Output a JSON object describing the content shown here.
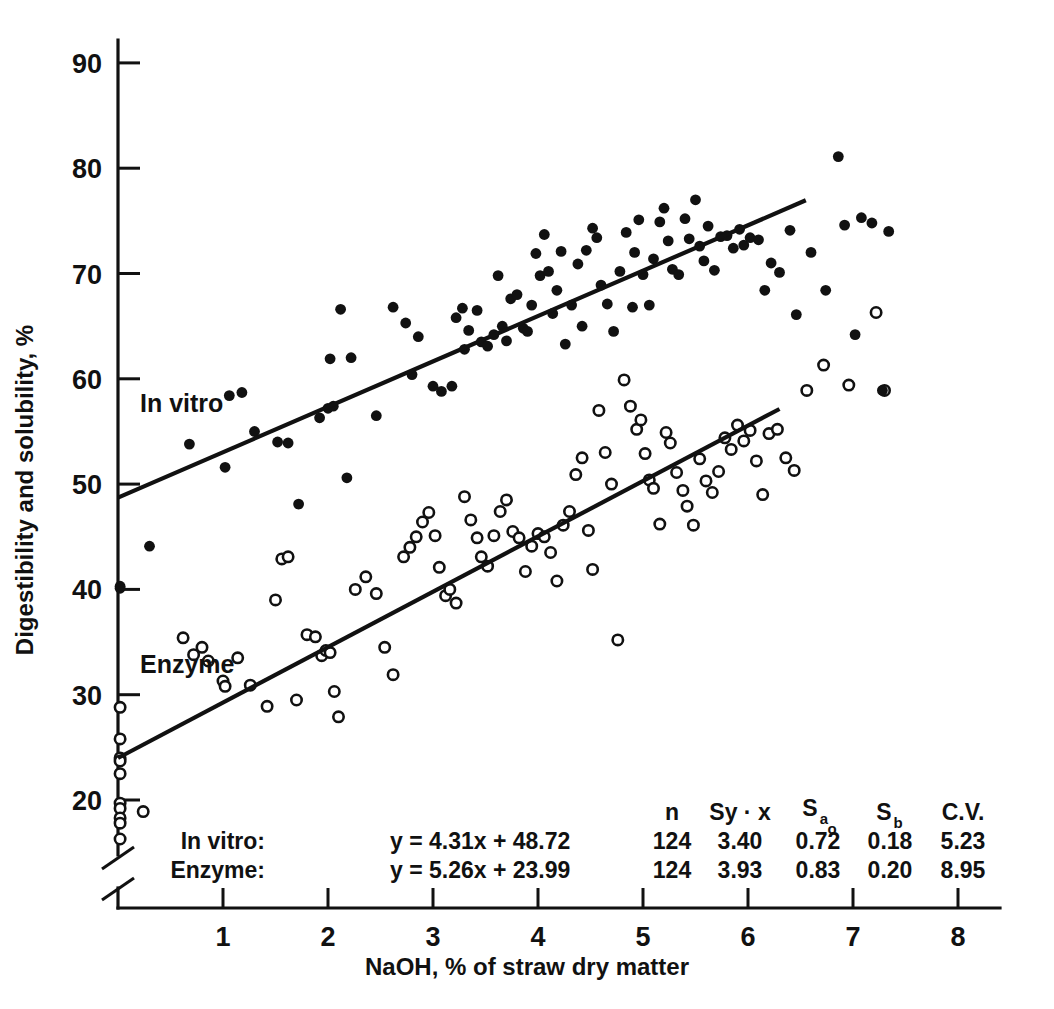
{
  "chart_data": {
    "type": "scatter",
    "title": "",
    "xlabel": "NaOH, % of straw dry matter",
    "ylabel": "Digestibility and solubility, %",
    "xlim": [
      0,
      8
    ],
    "ylim": [
      15,
      93
    ],
    "grid": false,
    "y_axis_broken": true,
    "xticks": [
      1,
      2,
      3,
      4,
      5,
      6,
      7,
      8
    ],
    "yticks": [
      20,
      30,
      40,
      50,
      60,
      70,
      80,
      90
    ],
    "legend_position": "inline-annotations",
    "series": [
      {
        "name": "In vitro",
        "marker": "filled-circle",
        "annotation": "In vitro",
        "fit": {
          "slope": 4.31,
          "intercept": 48.72,
          "x_start": 0.0,
          "x_end": 6.55
        },
        "points": [
          [
            0.02,
            40.3
          ],
          [
            0.02,
            40.1
          ],
          [
            0.3,
            44.1
          ],
          [
            0.68,
            53.8
          ],
          [
            1.02,
            51.6
          ],
          [
            1.18,
            58.7
          ],
          [
            1.06,
            58.4
          ],
          [
            1.3,
            55.0
          ],
          [
            1.52,
            54.0
          ],
          [
            1.62,
            53.9
          ],
          [
            1.72,
            48.1
          ],
          [
            1.92,
            56.3
          ],
          [
            2.0,
            57.2
          ],
          [
            2.05,
            57.4
          ],
          [
            2.12,
            66.6
          ],
          [
            2.02,
            61.9
          ],
          [
            2.22,
            62.0
          ],
          [
            2.18,
            50.6
          ],
          [
            2.46,
            56.5
          ],
          [
            2.62,
            66.8
          ],
          [
            2.74,
            65.3
          ],
          [
            2.8,
            60.4
          ],
          [
            2.86,
            64.0
          ],
          [
            3.0,
            59.3
          ],
          [
            3.08,
            58.8
          ],
          [
            3.18,
            59.3
          ],
          [
            3.22,
            65.8
          ],
          [
            3.28,
            66.7
          ],
          [
            3.34,
            64.6
          ],
          [
            3.3,
            62.8
          ],
          [
            3.42,
            66.5
          ],
          [
            3.46,
            63.5
          ],
          [
            3.52,
            63.1
          ],
          [
            3.58,
            64.2
          ],
          [
            3.62,
            69.8
          ],
          [
            3.66,
            65.0
          ],
          [
            3.7,
            63.6
          ],
          [
            3.74,
            67.6
          ],
          [
            3.8,
            68.0
          ],
          [
            3.86,
            64.8
          ],
          [
            3.9,
            64.5
          ],
          [
            3.94,
            67.0
          ],
          [
            3.98,
            71.9
          ],
          [
            4.02,
            69.8
          ],
          [
            4.06,
            73.7
          ],
          [
            4.1,
            70.2
          ],
          [
            4.14,
            66.2
          ],
          [
            4.18,
            68.4
          ],
          [
            4.22,
            72.1
          ],
          [
            4.26,
            63.3
          ],
          [
            4.32,
            67.0
          ],
          [
            4.38,
            70.9
          ],
          [
            4.42,
            65.0
          ],
          [
            4.46,
            72.2
          ],
          [
            4.52,
            74.3
          ],
          [
            4.56,
            73.4
          ],
          [
            4.6,
            68.9
          ],
          [
            4.66,
            67.1
          ],
          [
            4.72,
            64.5
          ],
          [
            4.78,
            70.2
          ],
          [
            4.84,
            73.9
          ],
          [
            4.9,
            66.8
          ],
          [
            4.96,
            75.1
          ],
          [
            4.92,
            72.0
          ],
          [
            5.0,
            69.9
          ],
          [
            5.06,
            67.0
          ],
          [
            5.1,
            71.4
          ],
          [
            5.16,
            74.9
          ],
          [
            5.2,
            76.2
          ],
          [
            5.24,
            73.1
          ],
          [
            5.28,
            70.4
          ],
          [
            5.34,
            69.9
          ],
          [
            5.4,
            75.2
          ],
          [
            5.44,
            73.3
          ],
          [
            5.5,
            77.0
          ],
          [
            5.54,
            72.6
          ],
          [
            5.58,
            71.2
          ],
          [
            5.62,
            74.5
          ],
          [
            5.68,
            70.3
          ],
          [
            5.74,
            73.5
          ],
          [
            5.8,
            73.6
          ],
          [
            5.86,
            72.4
          ],
          [
            5.92,
            74.2
          ],
          [
            5.96,
            72.7
          ],
          [
            6.02,
            73.4
          ],
          [
            6.1,
            73.2
          ],
          [
            6.16,
            68.4
          ],
          [
            6.22,
            71.0
          ],
          [
            6.3,
            70.1
          ],
          [
            6.4,
            74.1
          ],
          [
            6.46,
            66.1
          ],
          [
            6.6,
            72.0
          ],
          [
            6.74,
            68.4
          ],
          [
            6.86,
            81.1
          ],
          [
            6.92,
            74.6
          ],
          [
            7.02,
            64.2
          ],
          [
            7.08,
            75.3
          ],
          [
            7.18,
            74.8
          ],
          [
            7.28,
            58.9
          ],
          [
            7.34,
            74.0
          ]
        ]
      },
      {
        "name": "Enzyme",
        "marker": "open-circle",
        "annotation": "Enzyme",
        "fit": {
          "slope": 5.26,
          "intercept": 23.99,
          "x_start": 0.0,
          "x_end": 6.3
        },
        "points": [
          [
            0.02,
            28.8
          ],
          [
            0.02,
            25.8
          ],
          [
            0.02,
            24.0
          ],
          [
            0.02,
            23.7
          ],
          [
            0.02,
            22.5
          ],
          [
            0.02,
            19.7
          ],
          [
            0.02,
            19.2
          ],
          [
            0.02,
            18.3
          ],
          [
            0.02,
            17.8
          ],
          [
            0.02,
            16.3
          ],
          [
            0.24,
            18.9
          ],
          [
            0.62,
            35.4
          ],
          [
            0.72,
            33.8
          ],
          [
            0.8,
            34.5
          ],
          [
            0.86,
            33.2
          ],
          [
            1.0,
            31.3
          ],
          [
            1.02,
            30.8
          ],
          [
            1.14,
            33.5
          ],
          [
            1.26,
            30.9
          ],
          [
            1.42,
            28.9
          ],
          [
            1.5,
            39.0
          ],
          [
            1.56,
            42.9
          ],
          [
            1.62,
            43.1
          ],
          [
            1.7,
            29.5
          ],
          [
            1.8,
            35.7
          ],
          [
            1.88,
            35.5
          ],
          [
            1.94,
            33.7
          ],
          [
            1.98,
            34.2
          ],
          [
            2.02,
            34.0
          ],
          [
            2.06,
            30.3
          ],
          [
            2.1,
            27.9
          ],
          [
            2.26,
            40.0
          ],
          [
            2.36,
            41.2
          ],
          [
            2.46,
            39.6
          ],
          [
            2.54,
            34.5
          ],
          [
            2.62,
            31.9
          ],
          [
            2.72,
            43.1
          ],
          [
            2.78,
            44.0
          ],
          [
            2.84,
            45.0
          ],
          [
            2.9,
            46.4
          ],
          [
            2.96,
            47.3
          ],
          [
            3.02,
            45.1
          ],
          [
            3.06,
            42.1
          ],
          [
            3.12,
            39.4
          ],
          [
            3.16,
            40.0
          ],
          [
            3.22,
            38.7
          ],
          [
            3.3,
            48.8
          ],
          [
            3.36,
            46.6
          ],
          [
            3.42,
            44.9
          ],
          [
            3.46,
            43.1
          ],
          [
            3.52,
            42.2
          ],
          [
            3.58,
            45.1
          ],
          [
            3.64,
            47.4
          ],
          [
            3.7,
            48.5
          ],
          [
            3.76,
            45.5
          ],
          [
            3.82,
            44.9
          ],
          [
            3.88,
            41.7
          ],
          [
            3.94,
            44.1
          ],
          [
            4.0,
            45.3
          ],
          [
            4.06,
            45.0
          ],
          [
            4.12,
            43.5
          ],
          [
            4.18,
            40.8
          ],
          [
            4.24,
            46.1
          ],
          [
            4.3,
            47.4
          ],
          [
            4.36,
            50.9
          ],
          [
            4.42,
            52.5
          ],
          [
            4.48,
            45.6
          ],
          [
            4.52,
            41.9
          ],
          [
            4.58,
            57.0
          ],
          [
            4.64,
            53.0
          ],
          [
            4.7,
            50.0
          ],
          [
            4.76,
            35.2
          ],
          [
            4.82,
            59.9
          ],
          [
            4.88,
            57.4
          ],
          [
            4.94,
            55.2
          ],
          [
            4.98,
            56.1
          ],
          [
            5.02,
            52.9
          ],
          [
            5.06,
            50.4
          ],
          [
            5.1,
            49.6
          ],
          [
            5.16,
            46.2
          ],
          [
            5.22,
            54.9
          ],
          [
            5.26,
            53.9
          ],
          [
            5.32,
            51.1
          ],
          [
            5.38,
            49.4
          ],
          [
            5.42,
            47.9
          ],
          [
            5.48,
            46.1
          ],
          [
            5.54,
            52.4
          ],
          [
            5.6,
            50.3
          ],
          [
            5.66,
            49.2
          ],
          [
            5.72,
            51.2
          ],
          [
            5.78,
            54.4
          ],
          [
            5.84,
            53.3
          ],
          [
            5.9,
            55.6
          ],
          [
            5.96,
            54.1
          ],
          [
            6.02,
            55.1
          ],
          [
            6.08,
            52.2
          ],
          [
            6.14,
            49.0
          ],
          [
            6.2,
            54.8
          ],
          [
            6.28,
            55.2
          ],
          [
            6.36,
            52.5
          ],
          [
            6.44,
            51.3
          ],
          [
            6.56,
            58.9
          ],
          [
            6.72,
            61.3
          ],
          [
            6.96,
            59.4
          ],
          [
            7.22,
            66.3
          ],
          [
            7.3,
            58.9
          ]
        ]
      }
    ],
    "stats_table": {
      "headers": [
        "",
        "",
        "n",
        "Sy · x",
        "S",
        "S",
        "C.V."
      ],
      "header_display": [
        "n",
        "Sy · x",
        "S",
        "S",
        "C.V."
      ],
      "header_sub_ao": "a",
      "header_sub_ao2": "o",
      "header_sub_b": "b",
      "rows": [
        {
          "label": "In vitro:",
          "equation": "y = 4.31x + 48.72",
          "n": "124",
          "syx": "3.40",
          "sa0": "0.72",
          "sb": "0.18",
          "cv": "5.23"
        },
        {
          "label": "Enzyme:",
          "equation": "y = 5.26x + 23.99",
          "n": "124",
          "syx": "3.93",
          "sa0": "0.83",
          "sb": "0.20",
          "cv": "8.95"
        }
      ]
    }
  },
  "colors": {
    "ink": "#111111",
    "background": "#ffffff"
  }
}
